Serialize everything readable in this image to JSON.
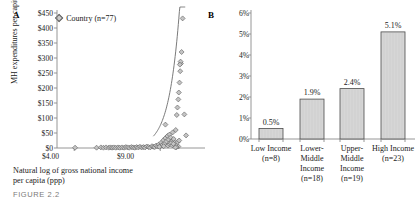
{
  "figure": {
    "caption": "FIGURE 2.2"
  },
  "panel_a": {
    "letter": "A",
    "legend_label": "Country (n=77)",
    "y_axis_title": "MH expenditures per capita",
    "x_axis_caption_line1": "Natural log of gross national income",
    "x_axis_caption_line2": "per capita (ppp)"
  },
  "panel_b": {
    "letter": "B"
  },
  "chart_data": [
    {
      "type": "scatter",
      "panel": "A",
      "title": "",
      "xlabel": "Natural log of gross national income per capita (ppp)",
      "ylabel": "MH expenditures per capita",
      "legend": [
        "Country (n=77)"
      ],
      "legend_position": "top-left",
      "grid": false,
      "xlim": [
        3.0,
        11.6
      ],
      "ylim": [
        0,
        450
      ],
      "xticks": [
        4.0,
        9.0
      ],
      "xtick_labels": [
        "$4.00",
        "$9.00"
      ],
      "yticks": [
        0,
        50,
        100,
        150,
        200,
        250,
        300,
        350,
        400,
        450
      ],
      "ytick_labels": [
        "$0",
        "$50",
        "$100",
        "$150",
        "$200",
        "$250",
        "$300",
        "$350",
        "$400",
        "$450"
      ],
      "marker": "diamond",
      "n": 77,
      "points": [
        [
          4.05,
          1
        ],
        [
          5.3,
          1
        ],
        [
          5.55,
          2
        ],
        [
          5.7,
          1
        ],
        [
          5.85,
          2
        ],
        [
          6.0,
          1
        ],
        [
          6.1,
          2
        ],
        [
          6.2,
          1
        ],
        [
          6.3,
          2
        ],
        [
          6.42,
          1
        ],
        [
          6.55,
          2
        ],
        [
          6.65,
          1
        ],
        [
          6.78,
          2
        ],
        [
          6.9,
          1
        ],
        [
          7.0,
          3
        ],
        [
          7.1,
          2
        ],
        [
          7.2,
          1
        ],
        [
          7.32,
          3
        ],
        [
          7.42,
          2
        ],
        [
          7.52,
          1
        ],
        [
          7.62,
          3
        ],
        [
          7.72,
          2
        ],
        [
          7.82,
          4
        ],
        [
          7.92,
          2
        ],
        [
          8.02,
          3
        ],
        [
          8.12,
          2
        ],
        [
          8.22,
          5
        ],
        [
          8.32,
          3
        ],
        [
          8.42,
          2
        ],
        [
          8.52,
          6
        ],
        [
          8.6,
          4
        ],
        [
          8.68,
          3
        ],
        [
          8.76,
          8
        ],
        [
          8.84,
          5
        ],
        [
          8.92,
          12
        ],
        [
          9.0,
          7
        ],
        [
          9.06,
          18
        ],
        [
          9.12,
          10
        ],
        [
          9.18,
          26
        ],
        [
          9.24,
          14
        ],
        [
          9.3,
          33
        ],
        [
          9.36,
          22
        ],
        [
          9.42,
          40
        ],
        [
          9.48,
          28
        ],
        [
          9.54,
          45
        ],
        [
          9.6,
          35
        ],
        [
          9.3,
          78
        ],
        [
          9.66,
          22
        ],
        [
          9.72,
          52
        ],
        [
          9.78,
          30
        ],
        [
          9.84,
          18
        ],
        [
          9.9,
          60
        ],
        [
          9.96,
          110
        ],
        [
          10.0,
          135
        ],
        [
          10.05,
          162
        ],
        [
          10.08,
          185
        ],
        [
          10.12,
          218
        ],
        [
          10.16,
          256
        ],
        [
          10.2,
          282
        ],
        [
          10.18,
          288
        ],
        [
          10.14,
          278
        ],
        [
          10.24,
          320
        ],
        [
          10.3,
          432
        ],
        [
          10.4,
          112
        ],
        [
          10.05,
          5
        ],
        [
          9.95,
          3
        ],
        [
          10.5,
          42
        ],
        [
          9.88,
          2
        ],
        [
          8.95,
          4
        ],
        [
          9.2,
          6
        ],
        [
          9.45,
          8
        ],
        [
          9.55,
          12
        ],
        [
          9.62,
          16
        ],
        [
          9.7,
          9
        ],
        [
          9.76,
          14
        ],
        [
          10.02,
          20
        ],
        [
          10.1,
          25
        ]
      ],
      "trend_curve": {
        "type": "exponential",
        "description": "upward-curving exponential fit line through the point cloud"
      }
    },
    {
      "type": "bar",
      "panel": "B",
      "title": "",
      "xlabel": "",
      "ylabel": "",
      "grid": false,
      "ylim": [
        0,
        6
      ],
      "yticks": [
        0,
        1,
        2,
        3,
        4,
        5,
        6
      ],
      "ytick_labels": [
        "0%",
        "1%",
        "2%",
        "3%",
        "4%",
        "5%",
        "6%"
      ],
      "categories": [
        "Low Income (n=8)",
        "Lower-Middle Income (n=18)",
        "Upper-Middle Income (n=19)",
        "High Income (n=23)"
      ],
      "category_lines": [
        [
          "Low Income",
          "(n=8)"
        ],
        [
          "Lower-",
          "Middle",
          "Income",
          "(n=18)"
        ],
        [
          "Upper-",
          "Middle",
          "Income",
          "(n=19)"
        ],
        [
          "High Income",
          "(n=23)"
        ]
      ],
      "values": [
        0.5,
        1.9,
        2.4,
        5.1
      ],
      "value_labels": [
        "0.5%",
        "1.9%",
        "2.4%",
        "5.1%"
      ],
      "bar_fill": "#d6d6d6",
      "bar_border": "#4a4a4a"
    }
  ]
}
